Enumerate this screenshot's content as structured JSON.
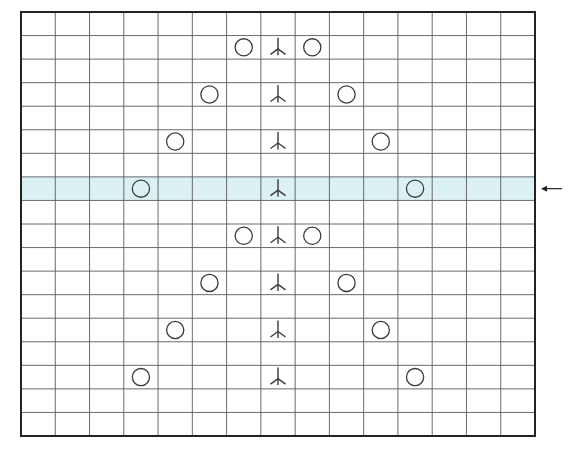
{
  "chart": {
    "type": "knitting-chart",
    "columns": 15,
    "rows": 18,
    "grid": {
      "left": 21,
      "top": 12,
      "right": 535,
      "bottom": 436
    },
    "highlighted_row": 7,
    "colors": {
      "grid_line": "#5a5a5a",
      "border": "#222222",
      "symbol": "#3a3a3a",
      "highlight": "#dcf1f3",
      "background": "#ffffff"
    },
    "arrow": {
      "direction": "left",
      "row": 7,
      "icon": "left-arrow-icon"
    },
    "legend_symbols": {
      "yo": "yarn-over-circle-icon",
      "cdd": "central-double-decrease-icon"
    },
    "symbols": [
      {
        "row": 1,
        "col": 6,
        "type": "yo"
      },
      {
        "row": 1,
        "col": 7,
        "type": "cdd"
      },
      {
        "row": 1,
        "col": 8,
        "type": "yo"
      },
      {
        "row": 3,
        "col": 5,
        "type": "yo"
      },
      {
        "row": 3,
        "col": 7,
        "type": "cdd"
      },
      {
        "row": 3,
        "col": 9,
        "type": "yo"
      },
      {
        "row": 5,
        "col": 4,
        "type": "yo"
      },
      {
        "row": 5,
        "col": 7,
        "type": "cdd"
      },
      {
        "row": 5,
        "col": 10,
        "type": "yo"
      },
      {
        "row": 7,
        "col": 3,
        "type": "yo"
      },
      {
        "row": 7,
        "col": 7,
        "type": "cdd"
      },
      {
        "row": 7,
        "col": 11,
        "type": "yo"
      },
      {
        "row": 9,
        "col": 6,
        "type": "yo"
      },
      {
        "row": 9,
        "col": 7,
        "type": "cdd"
      },
      {
        "row": 9,
        "col": 8,
        "type": "yo"
      },
      {
        "row": 11,
        "col": 5,
        "type": "yo"
      },
      {
        "row": 11,
        "col": 7,
        "type": "cdd"
      },
      {
        "row": 11,
        "col": 9,
        "type": "yo"
      },
      {
        "row": 13,
        "col": 4,
        "type": "yo"
      },
      {
        "row": 13,
        "col": 7,
        "type": "cdd"
      },
      {
        "row": 13,
        "col": 10,
        "type": "yo"
      },
      {
        "row": 15,
        "col": 3,
        "type": "yo"
      },
      {
        "row": 15,
        "col": 7,
        "type": "cdd"
      },
      {
        "row": 15,
        "col": 11,
        "type": "yo"
      }
    ]
  }
}
